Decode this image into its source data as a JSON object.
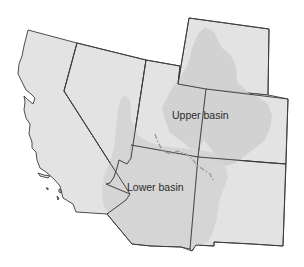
{
  "map": {
    "title": "Colorado River basin",
    "labels": {
      "upper_basin": "Upper basin",
      "lower_basin": "Lower basin"
    },
    "regions": [
      {
        "id": "california",
        "role": "state"
      },
      {
        "id": "nevada",
        "role": "state"
      },
      {
        "id": "utah",
        "role": "state"
      },
      {
        "id": "wyoming",
        "role": "state"
      },
      {
        "id": "colorado",
        "role": "state"
      },
      {
        "id": "arizona",
        "role": "state"
      },
      {
        "id": "new-mexico",
        "role": "state"
      }
    ],
    "colors": {
      "background": "#ffffff",
      "state_fill": "#e3e3e3",
      "basin_fill": "#cfcfcf",
      "border": "#3a3a3a",
      "divide_line": "#9a9a9a",
      "label_text": "#2a2a2a"
    }
  }
}
